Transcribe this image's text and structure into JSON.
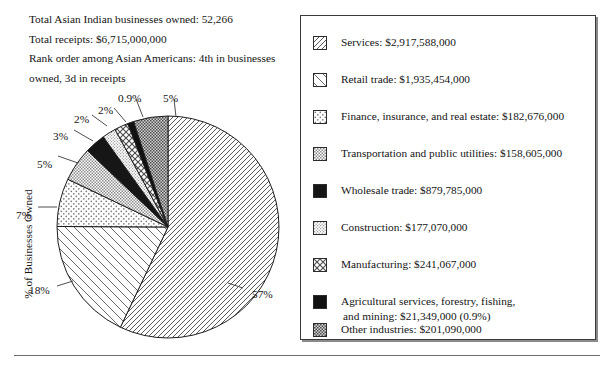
{
  "summary": {
    "line1": "Total Asian Indian businesses owned: 52,266",
    "line2": "Total receipts: $6,715,000,000",
    "line3": "Rank order among Asian Americans: 4th in businesses owned, 3d in receipts"
  },
  "axis": {
    "y_label": "% of Businesses Owned"
  },
  "legend": {
    "items": [
      {
        "label": "Services: $2,917,588,000",
        "label2": "",
        "pattern": "diagonal-backslash-sparse",
        "swatch_name": "swatch-services"
      },
      {
        "label": "Retail trade: $1,935,454,000",
        "label2": "",
        "pattern": "diagonal-slash-wide",
        "swatch_name": "swatch-retail-trade"
      },
      {
        "label": "Finance, insurance, and real estate: $182,676,000",
        "label2": "",
        "pattern": "fine-dots",
        "swatch_name": "swatch-finance-insurance-real-estate"
      },
      {
        "label": "Transportation and public utilities: $158,605,000",
        "label2": "",
        "pattern": "gray-stipple",
        "swatch_name": "swatch-transportation-public-utilities"
      },
      {
        "label": "Wholesale trade: $879,785,000",
        "label2": "",
        "pattern": "solid-black",
        "swatch_name": "swatch-wholesale-trade"
      },
      {
        "label": "Construction: $177,070,000",
        "label2": "",
        "pattern": "light-gray-stipple",
        "swatch_name": "swatch-construction"
      },
      {
        "label": "Manufacturing: $241,067,000",
        "label2": "",
        "pattern": "crosshatch-checker",
        "swatch_name": "swatch-manufacturing"
      },
      {
        "label": "Agricultural services, forestry, fishing,",
        "label2": "and mining: $21,349,000 (0.9%)",
        "pattern": "solid-black",
        "swatch_name": "swatch-agricultural-services"
      },
      {
        "label": "Other industries: $201,090,000",
        "label2": "",
        "pattern": "dark-checker",
        "swatch_name": "swatch-other-industries"
      }
    ]
  },
  "chart_data": {
    "type": "pie",
    "title": "",
    "xlabel": "",
    "ylabel": "% of Businesses Owned",
    "legend_position": "right",
    "start_angle_deg": 0,
    "direction": "clockwise",
    "categories": [
      "Services",
      "Retail trade",
      "Finance, insurance, and real estate",
      "Transportation and public utilities",
      "Wholesale trade",
      "Construction",
      "Manufacturing",
      "Agricultural services, forestry, fishing, and mining",
      "Other industries"
    ],
    "values": [
      57,
      18,
      7,
      5,
      3,
      2,
      2,
      0.9,
      5
    ],
    "value_labels": [
      "57%",
      "18%",
      "7%",
      "5%",
      "3%",
      "2%",
      "2%",
      "0.9%",
      "5%"
    ],
    "receipts": [
      "$2,917,588,000",
      "$1,935,454,000",
      "$182,676,000",
      "$158,605,000",
      "$879,785,000",
      "$177,070,000",
      "$241,067,000",
      "$21,349,000",
      "$201,090,000"
    ],
    "total_businesses": "52,266",
    "total_receipts": "$6,715,000,000"
  },
  "pie_labels": [
    {
      "text": "57%",
      "x": 252,
      "y": 288
    },
    {
      "text": "18%",
      "x": 29,
      "y": 284
    },
    {
      "text": "7%",
      "x": 16,
      "y": 209
    },
    {
      "text": "5%",
      "x": 37,
      "y": 158
    },
    {
      "text": "3%",
      "x": 53,
      "y": 130
    },
    {
      "text": "2%",
      "x": 74,
      "y": 113
    },
    {
      "text": "2%",
      "x": 98,
      "y": 104
    },
    {
      "text": "0.9%",
      "x": 118,
      "y": 92
    },
    {
      "text": "5%",
      "x": 163,
      "y": 92
    }
  ]
}
